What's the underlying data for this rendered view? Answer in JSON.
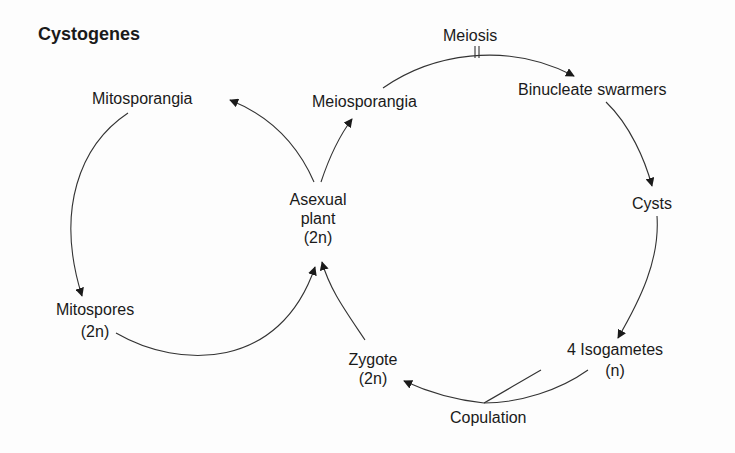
{
  "title": "Cystogenes",
  "nodes": {
    "mitosporangia": "Mitosporangia",
    "meiosporangia": "Meiosporangia",
    "asexual_plant": [
      "Asexual",
      "plant",
      "(2n)"
    ],
    "mitospores": [
      "Mitospores",
      "(2n)"
    ],
    "meiosis": "Meiosis",
    "binucleate_swarmers": "Binucleate swarmers",
    "cysts": "Cysts",
    "isogametes": [
      "4 Isogametes",
      "(n)"
    ],
    "copulation": "Copulation",
    "zygote": [
      "Zygote",
      "(2n)"
    ]
  },
  "edges": [
    {
      "from": "Asexual plant",
      "to": "Mitosporangia"
    },
    {
      "from": "Mitosporangia",
      "to": "Mitospores"
    },
    {
      "from": "Mitospores",
      "to": "Asexual plant"
    },
    {
      "from": "Asexual plant",
      "to": "Meiosporangia"
    },
    {
      "from": "Meiosporangia",
      "to": "Binucleate swarmers",
      "marker": "Meiosis"
    },
    {
      "from": "Binucleate swarmers",
      "to": "Cysts"
    },
    {
      "from": "Cysts",
      "to": "4 Isogametes"
    },
    {
      "from": "4 Isogametes",
      "to": "Zygote",
      "via": "Copulation"
    },
    {
      "from": "Zygote",
      "to": "Asexual plant"
    }
  ]
}
